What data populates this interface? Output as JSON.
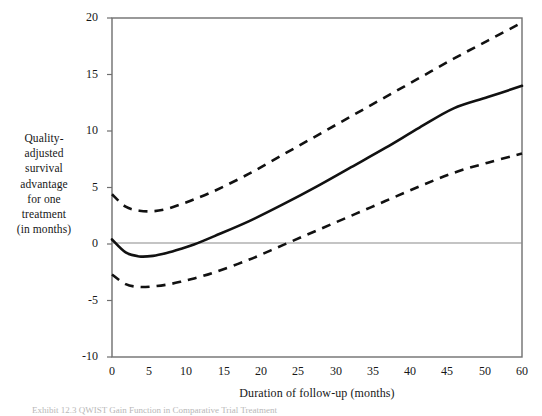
{
  "figure": {
    "caption": "Exhibit 12.3  QWIST Gain Function in Comparative Trial Treatment"
  },
  "chart_data": {
    "type": "line",
    "title": "",
    "xlabel": "Duration of follow-up (months)",
    "ylabel": "Quality-adjusted survival advantage for one treatment (in months)",
    "ylabel_lines": [
      "Quality-",
      "adjusted",
      "survival",
      "advantage",
      "for one",
      "treatment",
      "(in months)"
    ],
    "xlim": [
      0,
      60
    ],
    "ylim": [
      -10,
      20
    ],
    "xticks": [
      0,
      5,
      10,
      15,
      20,
      25,
      30,
      35,
      40,
      45,
      50,
      60
    ],
    "xtick_labels": [
      "0",
      "5",
      "10",
      "15",
      "20",
      "25",
      "30",
      "35",
      "40",
      "45",
      "50",
      "60"
    ],
    "yticks": [
      -10,
      -5,
      0,
      5,
      10,
      15,
      20
    ],
    "ytick_labels": [
      "-10",
      "-5",
      "0",
      "5",
      "10",
      "15",
      "20"
    ],
    "grid": false,
    "legend": "none",
    "reference_line": {
      "axis": "y",
      "value": 0,
      "style": "solid",
      "color": "#8a8a8a"
    },
    "x": [
      0,
      2,
      4,
      6,
      8,
      10,
      12,
      15,
      20,
      25,
      30,
      35,
      40,
      45,
      50,
      55,
      60
    ],
    "series": [
      {
        "name": "Upper 95% confidence limit",
        "style": "dashed",
        "color": "#111111",
        "values": [
          4.4,
          3.3,
          2.95,
          2.9,
          3.1,
          3.5,
          3.95,
          4.7,
          6.2,
          7.9,
          9.6,
          11.3,
          13.0,
          14.7,
          16.4,
          18.0,
          19.6
        ]
      },
      {
        "name": "Quality-adjusted survival advantage (point estimate)",
        "style": "solid",
        "color": "#111111",
        "values": [
          0.4,
          -0.75,
          -1.1,
          -1.05,
          -0.8,
          -0.45,
          -0.05,
          0.7,
          2.0,
          3.5,
          5.1,
          6.8,
          8.5,
          10.3,
          12.0,
          13.0,
          14.0
        ]
      },
      {
        "name": "Lower 95% confidence limit",
        "style": "dashed",
        "color": "#111111",
        "values": [
          -2.7,
          -3.55,
          -3.8,
          -3.75,
          -3.6,
          -3.35,
          -3.05,
          -2.5,
          -1.4,
          -0.1,
          1.2,
          2.5,
          3.8,
          5.1,
          6.3,
          7.2,
          8.0
        ]
      }
    ],
    "annotations": {
      "zero_crossing_solid_months": 11,
      "zero_crossing_lower_months": 25,
      "minimum_solid_value": -1.1,
      "minimum_solid_month": 4
    }
  },
  "axes": {
    "y_tick_positions_px": [
      357,
      301,
      243,
      187,
      131,
      75,
      18
    ],
    "x_tick_positions_px": [
      112,
      149,
      186,
      224,
      261,
      298,
      336,
      373,
      410,
      447,
      485,
      522
    ]
  }
}
